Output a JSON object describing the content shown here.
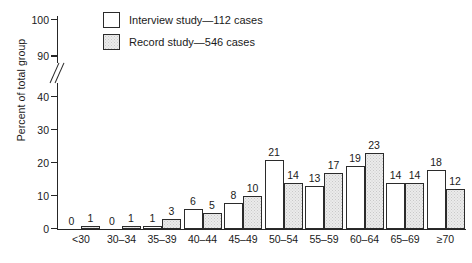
{
  "chart_data": {
    "type": "bar",
    "title": "",
    "xlabel": "",
    "ylabel": "Percent of total group",
    "categories": [
      "<30",
      "30–34",
      "35–39",
      "40–44",
      "45–49",
      "50–54",
      "55–59",
      "60–64",
      "65–69",
      "≥70"
    ],
    "series": [
      {
        "name": "Interview study—112 cases",
        "values": [
          0,
          0,
          1,
          6,
          8,
          21,
          13,
          19,
          14,
          18
        ],
        "fill": "#ffffff",
        "style": "open"
      },
      {
        "name": "Record study—546 cases",
        "values": [
          1,
          1,
          3,
          5,
          10,
          14,
          17,
          23,
          14,
          12
        ],
        "fill": "#ebebeb",
        "style": "stippled"
      }
    ],
    "ylim": [
      0,
      100
    ],
    "yticks": [
      0,
      10,
      20,
      30,
      40,
      90,
      100
    ],
    "ytick_labels": [
      "0",
      "10",
      "20",
      "30",
      "40",
      "90",
      "100"
    ],
    "axis_break": {
      "present": true,
      "between": [
        40,
        90
      ],
      "symbol": "//"
    },
    "grid": false,
    "legend_position": "top-left-inside",
    "axis_color": "#262626"
  },
  "legend": {
    "items": [
      {
        "label": "Interview study—112 cases"
      },
      {
        "label": "Record study—546 cases"
      }
    ]
  },
  "axes": {
    "y_title": "Percent of total group"
  }
}
